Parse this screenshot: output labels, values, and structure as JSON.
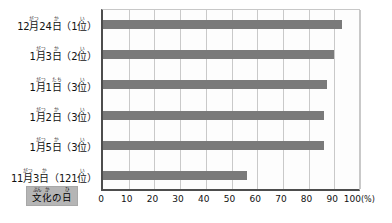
{
  "chart_data": {
    "type": "bar",
    "orientation": "horizontal",
    "title": "",
    "xlabel": "(%)",
    "ylabel": "",
    "xlim": [
      0,
      100
    ],
    "grid": true,
    "legend_position": "none",
    "bar_color": "#7a7a7a",
    "categories": [
      "12月24日（1位）",
      "1月3日（2位）",
      "1月1日（3位）",
      "1月2日（3位）",
      "1月5日（3位）",
      "11月3日（121位）"
    ],
    "values": [
      93,
      90,
      87,
      86,
      86,
      56
    ],
    "xticks": [
      0,
      10,
      20,
      30,
      40,
      50,
      60,
      70,
      80,
      90,
      100
    ],
    "xtick_labels": [
      "0",
      "10",
      "20",
      "30",
      "40",
      "50",
      "60",
      "70",
      "80",
      "90",
      "100"
    ],
    "xaxis_unit": "(%)"
  },
  "rows": [
    {
      "value": 93,
      "label_plain": "12月24日（1位）",
      "parts": [
        {
          "text": "12",
          "ruby": ""
        },
        {
          "text": "月",
          "ruby": "がつ"
        },
        {
          "text": "24",
          "ruby": ""
        },
        {
          "text": "日",
          "ruby": "か"
        },
        {
          "text": "（1",
          "ruby": ""
        },
        {
          "text": "位",
          "ruby": "い"
        },
        {
          "text": "）",
          "ruby": ""
        }
      ]
    },
    {
      "value": 90,
      "label_plain": "1月3日（2位）",
      "parts": [
        {
          "text": "1",
          "ruby": ""
        },
        {
          "text": "月",
          "ruby": "がつ"
        },
        {
          "text": "3",
          "ruby": ""
        },
        {
          "text": "日",
          "ruby": "か"
        },
        {
          "text": "（2",
          "ruby": ""
        },
        {
          "text": "位",
          "ruby": "い"
        },
        {
          "text": "）",
          "ruby": ""
        }
      ]
    },
    {
      "value": 87,
      "label_plain": "1月1日（3位）",
      "parts": [
        {
          "text": "1",
          "ruby": ""
        },
        {
          "text": "月",
          "ruby": "がつ"
        },
        {
          "text": "1",
          "ruby": ""
        },
        {
          "text": "日",
          "ruby": "たち"
        },
        {
          "text": "（3",
          "ruby": ""
        },
        {
          "text": "位",
          "ruby": "い"
        },
        {
          "text": "）",
          "ruby": ""
        }
      ]
    },
    {
      "value": 86,
      "label_plain": "1月2日（3位）",
      "parts": [
        {
          "text": "1",
          "ruby": ""
        },
        {
          "text": "月",
          "ruby": "がつ"
        },
        {
          "text": "2",
          "ruby": ""
        },
        {
          "text": "日",
          "ruby": "か"
        },
        {
          "text": "（3",
          "ruby": ""
        },
        {
          "text": "位",
          "ruby": "い"
        },
        {
          "text": "）",
          "ruby": ""
        }
      ]
    },
    {
      "value": 86,
      "label_plain": "1月5日（3位）",
      "parts": [
        {
          "text": "1",
          "ruby": ""
        },
        {
          "text": "月",
          "ruby": "がつ"
        },
        {
          "text": "5",
          "ruby": ""
        },
        {
          "text": "日",
          "ruby": "か"
        },
        {
          "text": "（3",
          "ruby": ""
        },
        {
          "text": "位",
          "ruby": "い"
        },
        {
          "text": "）",
          "ruby": ""
        }
      ]
    },
    {
      "value": 56,
      "label_plain": "11月3日（121位）",
      "parts": [
        {
          "text": "11",
          "ruby": ""
        },
        {
          "text": "月",
          "ruby": "がつ"
        },
        {
          "text": "3",
          "ruby": ""
        },
        {
          "text": "日",
          "ruby": "か"
        },
        {
          "text": "（121",
          "ruby": ""
        },
        {
          "text": "位",
          "ruby": "い"
        },
        {
          "text": "）",
          "ruby": ""
        }
      ]
    }
  ],
  "badge": {
    "text_plain": "文化の日",
    "background": "#b5b5b5",
    "parts": [
      {
        "text": "文",
        "ruby": "ぶん"
      },
      {
        "text": "化",
        "ruby": "か"
      },
      {
        "text": "の",
        "ruby": ""
      },
      {
        "text": "日",
        "ruby": "ひ"
      }
    ]
  }
}
